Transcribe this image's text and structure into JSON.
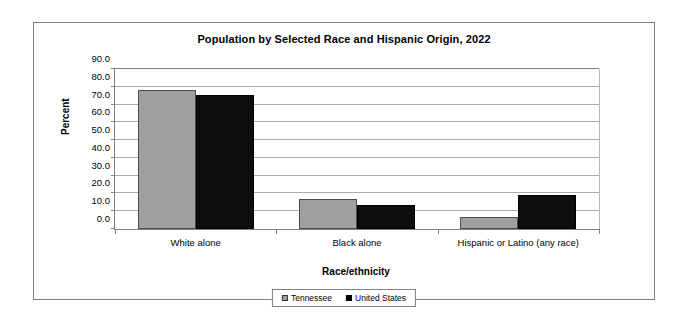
{
  "chart_data": {
    "type": "bar",
    "title": "Population by Selected Race and Hispanic Origin, 2022",
    "xlabel": "Race/ethnicity",
    "ylabel": "Percent",
    "categories": [
      "White alone",
      "Black alone",
      "Hispanic or Latino (any race)"
    ],
    "series": [
      {
        "name": "Tennessee",
        "color": "#a0a0a0",
        "values": [
          78.4,
          17.1,
          6.9
        ]
      },
      {
        "name": "United States",
        "color": "#000000",
        "values": [
          75.5,
          13.6,
          19.1
        ]
      }
    ],
    "ylim": [
      0.0,
      90.0
    ],
    "ytick_step": 10.0,
    "ytick_labels": [
      "0.0",
      "10.0",
      "20.0",
      "30.0",
      "40.0",
      "50.0",
      "60.0",
      "70.0",
      "80.0",
      "90.0"
    ],
    "grid": true,
    "legend_position": "bottom"
  }
}
